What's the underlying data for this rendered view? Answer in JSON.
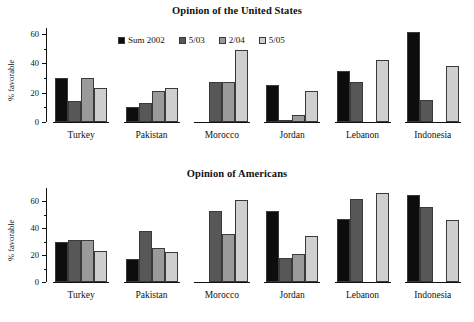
{
  "chart_data": [
    {
      "type": "bar",
      "title": "Opinion of the United States",
      "xlabel": "",
      "ylabel": "% favorable",
      "ylim": [
        0,
        64
      ],
      "yticks": [
        0,
        20,
        40,
        60
      ],
      "yticks_minor": [
        10,
        30,
        50
      ],
      "grid": false,
      "legend_position": "top-center",
      "categories": [
        "Turkey",
        "Pakistan",
        "Morocco",
        "Jordan",
        "Lebanon",
        "Indonesia"
      ],
      "series": [
        {
          "name": "Sum 2002",
          "color": "#0d0d0d",
          "values": [
            30,
            10,
            null,
            25,
            35,
            61
          ]
        },
        {
          "name": "5/03",
          "color": "#575757",
          "values": [
            14,
            13,
            27,
            1,
            27,
            15
          ]
        },
        {
          "name": "2/04",
          "color": "#9a9a9a",
          "values": [
            30,
            21,
            27,
            5,
            null,
            null
          ]
        },
        {
          "name": "5/05",
          "color": "#cfcfcf",
          "values": [
            23,
            23,
            49,
            21,
            42,
            38
          ]
        }
      ]
    },
    {
      "type": "bar",
      "title": "Opinion of Americans",
      "xlabel": "",
      "ylabel": "% favorable",
      "ylim": [
        0,
        70
      ],
      "yticks": [
        0,
        20,
        40,
        60
      ],
      "yticks_minor": [
        10,
        30,
        50
      ],
      "grid": false,
      "legend_position": "none",
      "categories": [
        "Turkey",
        "Pakistan",
        "Morocco",
        "Jordan",
        "Lebanon",
        "Indonesia"
      ],
      "series": [
        {
          "name": "Sum 2002",
          "color": "#0d0d0d",
          "values": [
            30,
            17,
            null,
            53,
            47,
            65
          ]
        },
        {
          "name": "5/03",
          "color": "#575757",
          "values": [
            31,
            38,
            53,
            18,
            62,
            56
          ]
        },
        {
          "name": "2/04",
          "color": "#9a9a9a",
          "values": [
            31,
            25,
            36,
            21,
            null,
            null
          ]
        },
        {
          "name": "5/05",
          "color": "#cfcfcf",
          "values": [
            23,
            22,
            61,
            34,
            66,
            46
          ]
        }
      ]
    }
  ],
  "top": {
    "title": "Opinion of the United States",
    "ylabel": "% favorable",
    "ytick_labels": [
      "0",
      "20",
      "40",
      "60"
    ],
    "group_labels": [
      "Turkey",
      "Pakistan",
      "Morocco",
      "Jordan",
      "Lebanon",
      "Indonesia"
    ],
    "legend": [
      {
        "label": "Sum 2002",
        "color": "#0d0d0d"
      },
      {
        "label": "5/03",
        "color": "#575757"
      },
      {
        "label": "2/04",
        "color": "#9a9a9a"
      },
      {
        "label": "5/05",
        "color": "#cfcfcf"
      }
    ]
  },
  "bottom": {
    "title": "Opinion of Americans",
    "ylabel": "% favorable",
    "ytick_labels": [
      "0",
      "20",
      "40",
      "60"
    ],
    "group_labels": [
      "Turkey",
      "Pakistan",
      "Morocco",
      "Jordan",
      "Lebanon",
      "Indonesia"
    ]
  }
}
